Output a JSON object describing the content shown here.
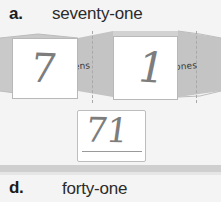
{
  "worksheet": {
    "background_color": "#f4f4f4",
    "problems": [
      {
        "id": "a",
        "label": "a.",
        "word_number": "seventy-one"
      },
      {
        "id": "d",
        "label": "d.",
        "word_number": "forty-one"
      }
    ],
    "place_value_strip": {
      "band_color": "#c9c9c9",
      "fold_labels": [
        {
          "name": "tens",
          "text": "tens"
        },
        {
          "name": "ones",
          "text": "ones"
        }
      ],
      "cards": [
        {
          "place": "tens",
          "handwritten_digit": "7"
        },
        {
          "place": "ones",
          "handwritten_digit": "1"
        }
      ]
    },
    "answer_box": {
      "handwritten_value": "71"
    }
  }
}
